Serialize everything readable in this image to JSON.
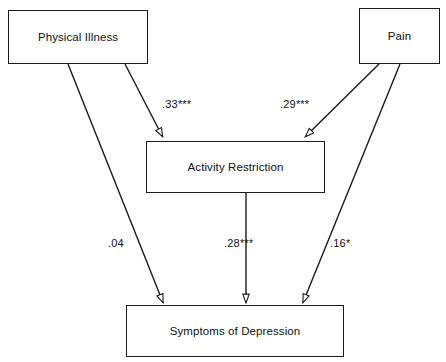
{
  "diagram": {
    "type": "path-diagram",
    "stroke_color": "#1a1a1a",
    "background_color": "#ffffff",
    "nodes": [
      {
        "id": "physical_illness",
        "label": "Physical Illness"
      },
      {
        "id": "pain",
        "label": "Pain"
      },
      {
        "id": "activity_restriction",
        "label": "Activity Restriction"
      },
      {
        "id": "symptoms_depression",
        "label": "Symptoms of Depression"
      }
    ],
    "edges": [
      {
        "id": "pi_to_ar",
        "from": "physical_illness",
        "to": "activity_restriction",
        "coefficient": ".33",
        "significance": "***",
        "label": ".33***"
      },
      {
        "id": "pain_to_ar",
        "from": "pain",
        "to": "activity_restriction",
        "coefficient": ".29",
        "significance": "***",
        "label": ".29***"
      },
      {
        "id": "pi_to_sd",
        "from": "physical_illness",
        "to": "symptoms_depression",
        "coefficient": ".04",
        "significance": "",
        "label": ".04"
      },
      {
        "id": "ar_to_sd",
        "from": "activity_restriction",
        "to": "symptoms_depression",
        "coefficient": ".28",
        "significance": "***",
        "label": ".28***"
      },
      {
        "id": "pain_to_sd",
        "from": "pain",
        "to": "symptoms_depression",
        "coefficient": ".16",
        "significance": "*",
        "label": ".16*"
      }
    ]
  }
}
